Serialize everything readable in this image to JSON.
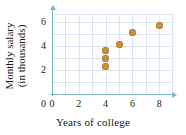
{
  "chart_data": {
    "type": "scatter",
    "title": "",
    "xlabel": "Years of college",
    "ylabel": "Monthly salary (in thousands)",
    "xlim": [
      0,
      9
    ],
    "ylim": [
      0,
      7
    ],
    "xticks": [
      "0",
      "2",
      "4",
      "6",
      "8"
    ],
    "yticks": [
      "0",
      "2",
      "4",
      "6"
    ],
    "grid": true,
    "legend": "none",
    "marker_color": "#c8903c",
    "grid_color": "#d9e6f2",
    "axis_color": "#7fb3c8",
    "points": [
      {
        "x": 4,
        "y": 2.3
      },
      {
        "x": 4,
        "y": 3.0
      },
      {
        "x": 4,
        "y": 3.6
      },
      {
        "x": 5,
        "y": 4.1
      },
      {
        "x": 6,
        "y": 5.1
      },
      {
        "x": 8,
        "y": 5.7
      }
    ]
  }
}
